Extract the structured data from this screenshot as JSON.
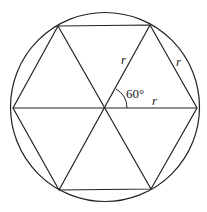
{
  "diagram": {
    "labels": {
      "radius_upper": "r",
      "side_right": "r",
      "radius_horizontal": "r",
      "angle": "60°"
    },
    "colors": {
      "stroke": "#222222",
      "background": "#ffffff"
    }
  }
}
